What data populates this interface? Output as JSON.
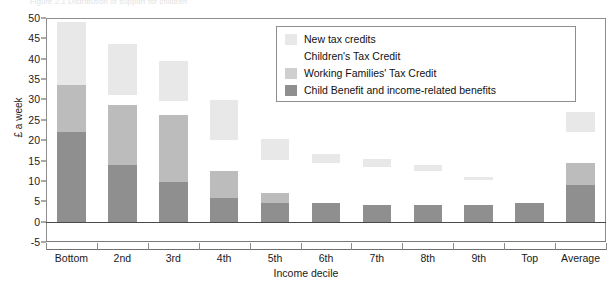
{
  "figure": {
    "caption": "Figure 2.1  Distribution of support for children"
  },
  "chart_data": {
    "type": "bar",
    "stacked": true,
    "title": "",
    "xlabel": "Income decile",
    "ylabel": "£ a week",
    "ylim": [
      -5,
      50
    ],
    "ytick_step": 5,
    "yticks": [
      50,
      45,
      40,
      35,
      30,
      25,
      20,
      15,
      10,
      5,
      0,
      -5
    ],
    "grid": false,
    "legend_position": "top-right",
    "categories": [
      "Bottom",
      "2nd",
      "3rd",
      "4th",
      "5th",
      "6th",
      "7th",
      "8th",
      "9th",
      "Top",
      "Average"
    ],
    "series": [
      {
        "name": "Child Benefit and income-related benefits",
        "color": "#8f8f8f",
        "values": [
          22.0,
          14.0,
          9.7,
          5.8,
          4.5,
          4.5,
          4.0,
          4.2,
          4.2,
          4.5,
          9.0
        ]
      },
      {
        "name": "Working Families' Tax Credit",
        "color": "#bcbcbc",
        "values": [
          11.5,
          14.7,
          16.5,
          6.6,
          2.5,
          0.0,
          0.0,
          0.0,
          0.0,
          0.0,
          5.4
        ]
      },
      {
        "name": "Children's Tax Credit",
        "color": "#ffffff",
        "values": [
          0.0,
          2.3,
          3.3,
          7.6,
          8.2,
          10.0,
          9.5,
          8.3,
          6.0,
          0.0,
          7.6
        ]
      },
      {
        "name": "New tax credits",
        "color": "#e8e8e8",
        "values": [
          15.5,
          12.5,
          10.0,
          9.8,
          5.0,
          2.0,
          2.0,
          1.5,
          0.8,
          0.0,
          5.0
        ]
      }
    ]
  },
  "legend": {
    "items": [
      {
        "label": "New tax credits",
        "color": "#e8e8e8"
      },
      {
        "label": "Children's Tax Credit",
        "color": "#ffffff"
      },
      {
        "label": "Working Families' Tax Credit",
        "color": "#cfcfcf"
      },
      {
        "label": "Child Benefit and income-related benefits",
        "color": "#8f8f8f"
      }
    ]
  }
}
